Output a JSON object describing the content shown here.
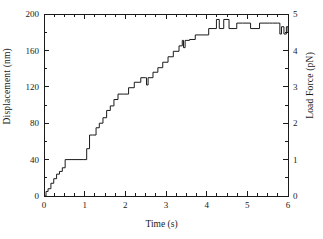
{
  "chart_data": {
    "type": "line",
    "subtype": "staircase-step-trace",
    "title": "",
    "xlabel": "Time (s)",
    "ylabel": "Displacement (nm)",
    "ylabel_right": "Load Force (pN)",
    "xlim": [
      0,
      6
    ],
    "ylim": [
      0,
      200
    ],
    "ylim_right": [
      0,
      5
    ],
    "xticks": [
      0,
      1,
      2,
      3,
      4,
      5,
      6
    ],
    "xtick_labels": [
      "0",
      "1",
      "2",
      "3",
      "4",
      "5",
      "6"
    ],
    "yticks": [
      0,
      40,
      80,
      120,
      160,
      200
    ],
    "ytick_labels": [
      "0",
      "40",
      "80",
      "120",
      "160",
      "200"
    ],
    "yticks_right": [
      0,
      1,
      2,
      3,
      4,
      5
    ],
    "ytick_labels_right": [
      "0",
      "1",
      "2",
      "3",
      "4",
      "5"
    ],
    "x_minor_interval": 0.25,
    "y_minor_interval": 20,
    "y_right_minor_interval": 0.5,
    "grid": false,
    "legend": null,
    "line_color": "#1a1a1a",
    "line_width": 1,
    "series": [
      {
        "name": "displacement",
        "step": "post",
        "x": [
          0.0,
          0.05,
          0.1,
          0.17,
          0.24,
          0.31,
          0.38,
          0.45,
          0.52,
          0.98,
          1.05,
          1.12,
          1.2,
          1.28,
          1.36,
          1.45,
          1.54,
          1.63,
          1.72,
          1.82,
          1.95,
          2.08,
          2.22,
          2.38,
          2.5,
          2.52,
          2.56,
          2.68,
          2.8,
          2.92,
          3.05,
          3.18,
          3.32,
          3.4,
          3.43,
          3.47,
          3.58,
          3.72,
          3.86,
          4.05,
          4.18,
          4.24,
          4.31,
          4.42,
          4.55,
          4.74,
          4.88,
          5.08,
          5.3,
          5.55,
          5.62,
          5.74,
          5.8,
          5.84,
          5.9,
          5.96,
          6.0
        ],
        "y": [
          0,
          5,
          8,
          14,
          19,
          24,
          27,
          31,
          40,
          40,
          52,
          67,
          67,
          75,
          80,
          86,
          94,
          99,
          106,
          112,
          112,
          119,
          125,
          130,
          130,
          122,
          130,
          136,
          141,
          147,
          153,
          159,
          165,
          171,
          163,
          171,
          172,
          177,
          177,
          184,
          184,
          194,
          184,
          194,
          184,
          190,
          190,
          184,
          190,
          190,
          190,
          190,
          178,
          186,
          178,
          186,
          180
        ],
        "units": "nm"
      }
    ]
  },
  "figure": {
    "axis_color": "#1a1a1a",
    "background": "#ffffff"
  }
}
